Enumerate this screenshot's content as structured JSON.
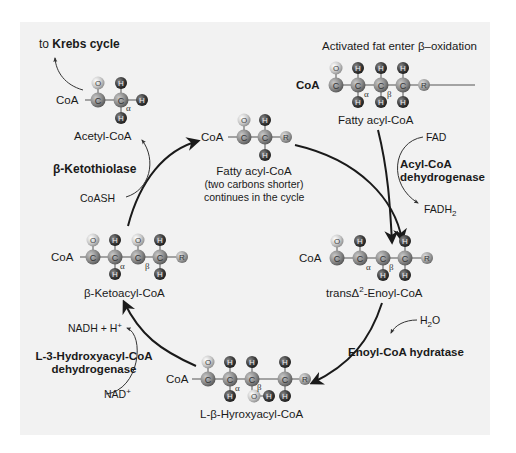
{
  "colors": {
    "panel": "#f2f2f2",
    "carbon": "#8c8c8c",
    "hydrogen": "#4a4a4a",
    "oxygen": "#c8c8c8",
    "r_group": "#9a9a9a",
    "arrow": "#1a1a1a"
  },
  "header": {
    "entry": "Activated fat enter β–oxidation",
    "krebs_prefix": "to ",
    "krebs_bold": "Krebs cycle"
  },
  "molecules": {
    "fatty_acyl_coa": {
      "name": "Fatty acyl-CoA",
      "coa": "CoA"
    },
    "enoyl_coa": {
      "name_prefix": "transΔ",
      "name_sup": "2",
      "name_suffix": "-Enoyl-CoA",
      "coa": "CoA"
    },
    "hydroxyacyl_coa": {
      "name": "L-β-Hyroxyacyl-CoA",
      "coa": "CoA"
    },
    "ketoacyl_coa": {
      "name": "β-Ketoacyl-CoA",
      "coa": "CoA"
    },
    "acetyl_coa": {
      "name": "Acetyl-CoA",
      "coa": "CoA"
    },
    "shorter_acyl_coa": {
      "name": "Fatty acyl-CoA",
      "line2": "(two carbons shorter)",
      "line3": "continues in the cycle",
      "coa": "CoA"
    }
  },
  "enzymes": {
    "step1": {
      "line1": "Acyl-CoA",
      "line2": "dehydrogenase"
    },
    "step2": {
      "line1": "Enoyl-CoA hydratase"
    },
    "step3": {
      "line1": "L-3-Hydroxyacyl-CoA",
      "line2": "dehydrogenase"
    },
    "step4": {
      "line1": "β-Ketothiolase"
    }
  },
  "cofactors": {
    "fad": "FAD",
    "fadh2_base": "FADH",
    "fadh2_sub": "2",
    "h2o_pre": "H",
    "h2o_sub": "2",
    "h2o_post": "O",
    "nadh": "NADH + H",
    "nadh_sup": "+",
    "nad": "NAD",
    "nad_sup": "+",
    "coash": "CoASH"
  },
  "atoms": {
    "C": "C",
    "H": "H",
    "O": "O",
    "R": "R",
    "alpha": "α",
    "beta": "β"
  }
}
